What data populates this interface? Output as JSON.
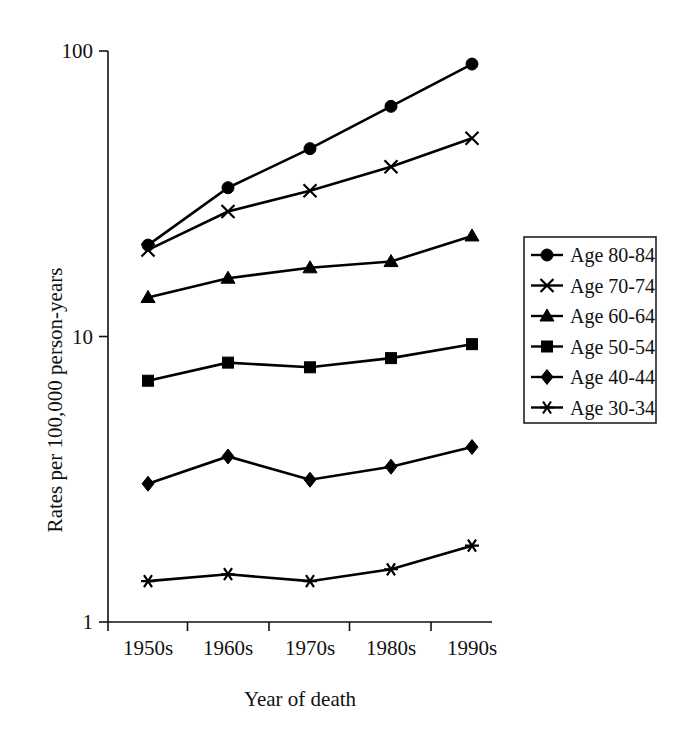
{
  "chart_data": {
    "type": "line",
    "title": "",
    "xlabel": "Year of death",
    "ylabel": "Rates per 100,000 person-years",
    "categories": [
      "1950s",
      "1960s",
      "1970s",
      "1980s",
      "1990s"
    ],
    "yscale": "log",
    "ylim": [
      1,
      100
    ],
    "ytick_labels": [
      "1",
      "10",
      "100"
    ],
    "ytick_values": [
      1,
      10,
      100
    ],
    "grid": false,
    "legend_position": "right",
    "series": [
      {
        "name": "Age 80-84",
        "marker": "circle",
        "values": [
          20.9,
          33.2,
          45.5,
          64.0,
          90.0
        ]
      },
      {
        "name": "Age 70-74",
        "marker": "cross",
        "values": [
          20.1,
          27.4,
          32.4,
          39.3,
          49.5
        ]
      },
      {
        "name": "Age 60-64",
        "marker": "triangle",
        "values": [
          13.7,
          16.0,
          17.4,
          18.3,
          22.5
        ]
      },
      {
        "name": "Age 50-54",
        "marker": "square",
        "values": [
          7.0,
          8.1,
          7.8,
          8.4,
          9.4
        ]
      },
      {
        "name": "Age 40-44",
        "marker": "diamond",
        "values": [
          3.05,
          3.8,
          3.15,
          3.5,
          4.1
        ]
      },
      {
        "name": "Age 30-34",
        "marker": "asterisk",
        "values": [
          1.39,
          1.47,
          1.39,
          1.53,
          1.85
        ]
      }
    ]
  },
  "colors": {
    "ink": "#000000",
    "axis": "#111111",
    "background": "#ffffff"
  }
}
